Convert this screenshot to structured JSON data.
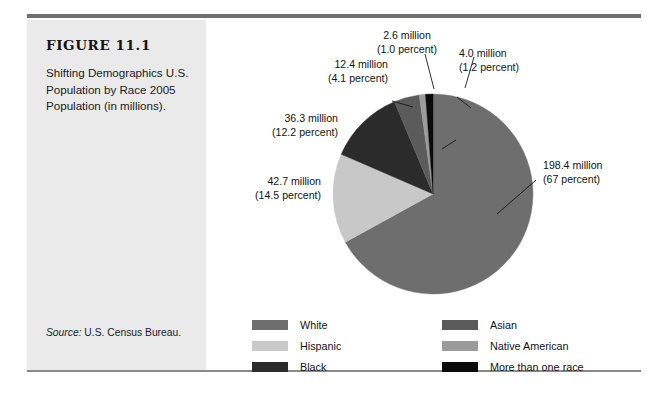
{
  "figure": {
    "number": "FIGURE 11.1",
    "caption": "Shifting Demographics U.S. Population by Race 2005 Population (in millions).",
    "source_label": "Source:",
    "source_text": " U.S. Census Bureau."
  },
  "chart_data": {
    "type": "pie",
    "title": "Shifting Demographics U.S. Population by Race 2005 Population (in millions)",
    "legend_position": "bottom",
    "unit": "millions",
    "categories": [
      "White",
      "Hispanic",
      "Black",
      "Asian",
      "Native American",
      "More than one race"
    ],
    "values": [
      198.4,
      42.7,
      36.3,
      12.4,
      2.6,
      4.0
    ],
    "percents": [
      67.0,
      14.5,
      12.2,
      4.1,
      1.0,
      1.2
    ],
    "colors": [
      "#6e6e6e",
      "#c8c8c8",
      "#2b2b2b",
      "#5b5b5b",
      "#9b9b9b",
      "#0b0b0b"
    ],
    "slice_order": [
      "White",
      "Hispanic",
      "Black",
      "Asian",
      "Native American",
      "More than one race"
    ],
    "labels": [
      {
        "key": "white",
        "value": "198.4 million",
        "percent": "(67 percent)"
      },
      {
        "key": "hispanic",
        "value": "42.7 million",
        "percent": "(14.5 percent)"
      },
      {
        "key": "black",
        "value": "36.3 million",
        "percent": "(12.2 percent)"
      },
      {
        "key": "asian",
        "value": "12.4 million",
        "percent": "(4.1 percent)"
      },
      {
        "key": "native_american",
        "value": "2.6 million",
        "percent": "(1.0 percent)"
      },
      {
        "key": "more_than_one_race",
        "value": "4.0 million",
        "percent": "(1.2 percent)"
      }
    ]
  },
  "callouts": {
    "native_american": {
      "l1": "2.6 million",
      "l2": "(1.0 percent)"
    },
    "more_than_one_race": {
      "l1": "4.0 million",
      "l2": "(1.2 percent)"
    },
    "asian": {
      "l1": "12.4 million",
      "l2": "(4.1 percent)"
    },
    "black": {
      "l1": "36.3 million",
      "l2": "(12.2 percent)"
    },
    "hispanic": {
      "l1": "42.7 million",
      "l2": "(14.5 percent)"
    },
    "white": {
      "l1": "198.4 million",
      "l2": "(67 percent)"
    }
  },
  "legend": {
    "column_a": [
      {
        "label": "White",
        "color": "#6e6e6e"
      },
      {
        "label": "Hispanic",
        "color": "#c8c8c8"
      },
      {
        "label": "Black",
        "color": "#2b2b2b"
      }
    ],
    "column_b": [
      {
        "label": "Asian",
        "color": "#5b5b5b"
      },
      {
        "label": "Native American",
        "color": "#9b9b9b"
      },
      {
        "label": "More than one race",
        "color": "#0b0b0b"
      }
    ]
  }
}
